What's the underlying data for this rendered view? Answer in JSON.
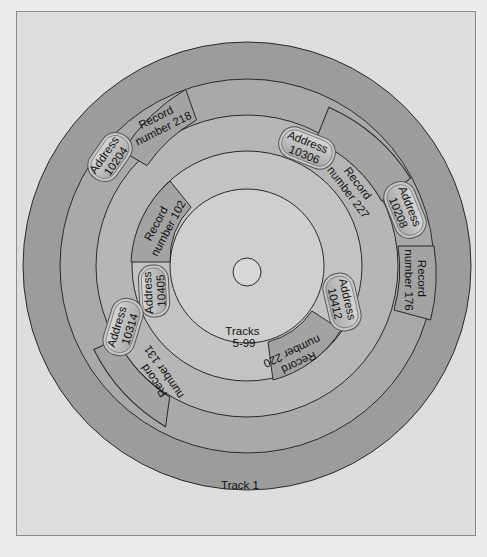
{
  "diagram": {
    "colors": {
      "background": "#ececec",
      "panel": "#dcdcdc",
      "panel_border": "#8a8a8a",
      "track_outer": "#9a9a9a",
      "track_middle": "#b3b3b3",
      "track_inner": "#c4c4c4",
      "center": "#d8d8d8",
      "record_block": "#a2a2a2",
      "address_pill": "#bdbdbd",
      "line": "#2a2a2a"
    },
    "tracks": {
      "outer_label": "Track 1",
      "inner_label_line1": "Tracks",
      "inner_label_line2": "5-99"
    },
    "records": [
      {
        "id": "r218",
        "line1": "Record",
        "line2": "number 218"
      },
      {
        "id": "r227",
        "line1": "Record",
        "line2": "number 227"
      },
      {
        "id": "r176",
        "line1": "Record",
        "line2": "number 176"
      },
      {
        "id": "r102",
        "line1": "Record",
        "line2": "number 102"
      },
      {
        "id": "r131",
        "line1": "Record",
        "line2": "number 131"
      },
      {
        "id": "r220",
        "line1": "Record",
        "line2": "number 220"
      }
    ],
    "addresses": [
      {
        "id": "a10204",
        "line1": "Address",
        "line2": "10204"
      },
      {
        "id": "a10306",
        "line1": "Address",
        "line2": "10306"
      },
      {
        "id": "a10208",
        "line1": "Address",
        "line2": "10208"
      },
      {
        "id": "a10405",
        "line1": "Address",
        "line2": "10405"
      },
      {
        "id": "a10314",
        "line1": "Address",
        "line2": "10314"
      },
      {
        "id": "a10412",
        "line1": "Address",
        "line2": "10412"
      }
    ]
  }
}
